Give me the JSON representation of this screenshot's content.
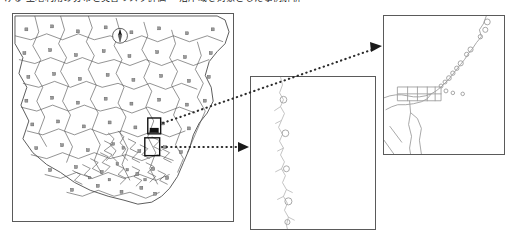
{
  "figure": {
    "caption_top": "ける 土地利用の分布と災害リスク評価 ―沿岸域を対象とした事例解析―",
    "panels": [
      {
        "id": "overview",
        "name": "regional-overview-map",
        "label": ""
      },
      {
        "id": "mid",
        "name": "coastline-intermediate-map",
        "label": ""
      },
      {
        "id": "detail",
        "name": "coastal-site-detail-map",
        "label": ""
      }
    ],
    "compass": {
      "label": "N",
      "icon": "north-arrow-icon"
    },
    "inset_boxes": [
      {
        "name": "inset-box-upper",
        "x": 148,
        "y": 118,
        "w": 13,
        "h": 16
      },
      {
        "name": "inset-box-lower",
        "x": 145,
        "y": 138,
        "w": 15,
        "h": 18
      }
    ],
    "connectors": [
      {
        "name": "connector-upper",
        "from": [
          162,
          124
        ],
        "to": [
          381,
          49
        ],
        "style": "dotted-arrow"
      },
      {
        "name": "connector-lower",
        "from": [
          161,
          147
        ],
        "to": [
          248,
          147
        ],
        "style": "dotted-arrow"
      }
    ],
    "colors": {
      "panel_border": "#5a5a5a",
      "boundary_line": "#4a4a4a",
      "coastline_light": "#b9b9b9",
      "marker_fill": "#8d8d8d",
      "connector": "#2b2b2b",
      "background": "#ffffff"
    },
    "overview_markers_count": 64,
    "mid_markers_count": 5,
    "detail_markers_count": 14
  }
}
